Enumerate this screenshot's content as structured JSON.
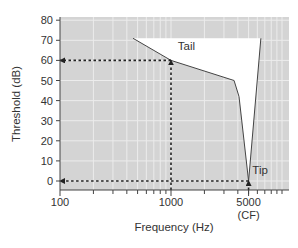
{
  "chart_data": {
    "type": "line",
    "title": "",
    "xlabel": "Frequency (Hz)",
    "ylabel": "Threshold (dB)",
    "xscale": "log",
    "xlim": [
      100,
      11500
    ],
    "ylim": [
      -4.5,
      82
    ],
    "grid": true,
    "legend": null,
    "x_ticks": [
      {
        "value": 100,
        "label": "100"
      },
      {
        "value": 1000,
        "label": "1000"
      },
      {
        "value": 5000,
        "label": "5000",
        "sublabel": "(CF)"
      }
    ],
    "x_minor_ticks": [
      200,
      300,
      400,
      500,
      600,
      700,
      800,
      900,
      2000,
      3000,
      4000,
      5000,
      6000,
      7000,
      8000,
      9000,
      10000
    ],
    "y_ticks": [
      0,
      10,
      20,
      30,
      40,
      50,
      60,
      70,
      80
    ],
    "series": [
      {
        "name": "Tuning curve",
        "points": [
          {
            "x": 455,
            "y": 71
          },
          {
            "x": 1000,
            "y": 60
          },
          {
            "x": 3700,
            "y": 50
          },
          {
            "x": 4100,
            "y": 42
          },
          {
            "x": 5000,
            "y": 0
          },
          {
            "x": 6450,
            "y": 71
          }
        ],
        "fill_above_to": 71
      }
    ],
    "reference_lines": [
      {
        "type": "dotted-arrow",
        "from": {
          "x": 1000,
          "y": 60
        },
        "to": {
          "x": 100,
          "y": 60
        }
      },
      {
        "type": "dotted-arrow",
        "from": {
          "x": 1000,
          "y": -4.5
        },
        "to": {
          "x": 1000,
          "y": 60
        }
      },
      {
        "type": "dotted-arrow",
        "from": {
          "x": 5000,
          "y": 0
        },
        "to": {
          "x": 100,
          "y": 0
        }
      },
      {
        "type": "dotted-arrow",
        "from": {
          "x": 5000,
          "y": -4.5
        },
        "to": {
          "x": 5000,
          "y": 0
        }
      }
    ],
    "annotations": [
      {
        "text": "Tail",
        "x": 1150,
        "y": 65
      },
      {
        "text": "Tip",
        "x": 5400,
        "y": 3.5
      }
    ]
  },
  "colors": {
    "plot_bg": "#d4d4d4",
    "grid": "#ececec",
    "fill_region": "#ffffff",
    "curve": "#444444",
    "axis": "#444444",
    "dotted": "#222222"
  }
}
